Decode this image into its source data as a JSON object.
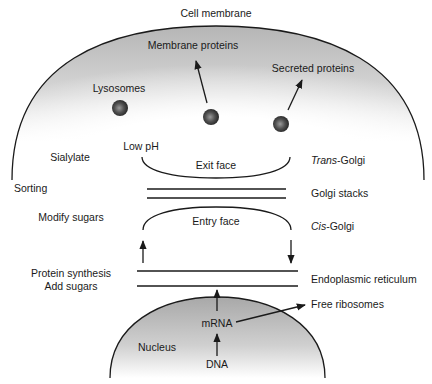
{
  "colors": {
    "line": "#1a1a1a",
    "cell_shade": "#b8b8b8",
    "nucleus_shade": "#b0b0b0",
    "vesicle": "#444444",
    "background": "#ffffff"
  },
  "labels": {
    "cell_membrane": "Cell membrane",
    "membrane_proteins": "Membrane proteins",
    "secreted_proteins": "Secreted proteins",
    "lysosomes": "Lysosomes",
    "low_ph": "Low pH",
    "sialylate": "Sialylate",
    "sorting": "Sorting",
    "exit_face": "Exit face",
    "trans_golgi_prefix": "Trans",
    "trans_golgi_suffix": "-Golgi",
    "golgi_stacks": "Golgi stacks",
    "modify_sugars": "Modify sugars",
    "entry_face": "Entry face",
    "cis_golgi_prefix": "Cis",
    "cis_golgi_suffix": "-Golgi",
    "protein_synthesis": "Protein synthesis",
    "add_sugars": "Add sugars",
    "endoplasmic_reticulum": "Endoplasmic reticulum",
    "free_ribosomes": "Free ribosomes",
    "mrna": "mRNA",
    "nucleus": "Nucleus",
    "dna": "DNA"
  }
}
